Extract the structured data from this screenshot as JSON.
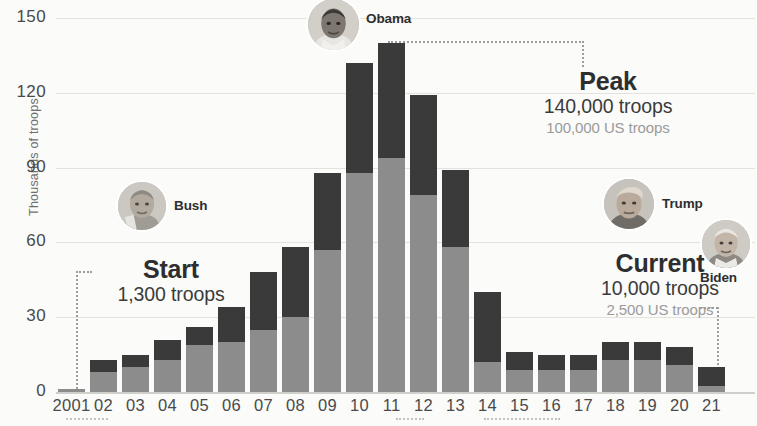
{
  "chart_data": {
    "type": "bar",
    "title": "",
    "subtitle": "",
    "xlabel": "",
    "ylabel": "Thousands of troops",
    "stacked": true,
    "grid": true,
    "legend_position": "none",
    "ylim": [
      0,
      150
    ],
    "yticks": [
      0,
      30,
      60,
      90,
      120,
      150
    ],
    "ytick_labels": [
      "0",
      "30",
      "60",
      "90",
      "120",
      "150"
    ],
    "categories": [
      "2001",
      "02",
      "03",
      "04",
      "05",
      "06",
      "07",
      "08",
      "09",
      "10",
      "11",
      "12",
      "13",
      "14",
      "15",
      "16",
      "17",
      "18",
      "19",
      "20",
      "21"
    ],
    "series": [
      {
        "name": "US troops",
        "color": "#8c8c8c",
        "values": [
          1.3,
          8,
          10,
          13,
          19,
          20,
          25,
          30,
          57,
          88,
          94,
          79,
          58,
          12,
          9,
          9,
          9,
          13,
          13,
          11,
          2.5
        ]
      },
      {
        "name": "Other coalition troops",
        "color": "#3a3a3a",
        "values": [
          0,
          5,
          5,
          8,
          7,
          14,
          23,
          28,
          31,
          44,
          46,
          40,
          31,
          28,
          7,
          6,
          6,
          7,
          7,
          7,
          7.5
        ]
      }
    ],
    "totals": [
      1.3,
      13,
      15,
      21,
      26,
      34,
      48,
      58,
      88,
      132,
      140,
      119,
      89,
      40,
      16,
      15,
      15,
      20,
      20,
      18,
      10
    ],
    "annotations": [
      {
        "id": "start",
        "title": "Start",
        "line1": "1,300 troops",
        "line2": "",
        "target_category": "2001"
      },
      {
        "id": "peak",
        "title": "Peak",
        "line1": "140,000 troops",
        "line2": "100,000 US troops",
        "target_category": "11"
      },
      {
        "id": "current",
        "title": "Current",
        "line1": "10,000 troops",
        "line2": "2,500 US troops",
        "target_category": "21"
      }
    ],
    "presidents": [
      {
        "id": "bush",
        "name": "Bush"
      },
      {
        "id": "obama",
        "name": "Obama"
      },
      {
        "id": "trump",
        "name": "Trump"
      },
      {
        "id": "biden",
        "name": "Biden"
      }
    ]
  },
  "axis": {
    "y_title": "Thousands of troops"
  }
}
